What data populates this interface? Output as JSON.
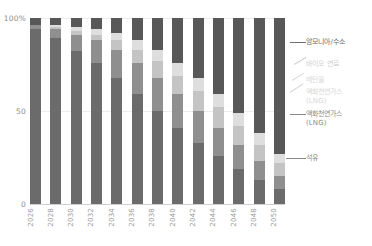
{
  "chart_data": {
    "type": "bar",
    "stacked": true,
    "normalized": true,
    "title": "",
    "subtitle": "",
    "xlabel": "",
    "ylabel": "",
    "ylim": [
      0,
      100
    ],
    "yticks": [
      "0",
      "50",
      "100%"
    ],
    "ytick_values": [
      0,
      50,
      100
    ],
    "grid": true,
    "legend_position": "right",
    "categories": [
      "2026",
      "2028",
      "2030",
      "2032",
      "2034",
      "2036",
      "2038",
      "2040",
      "2042",
      "2044",
      "2046",
      "2048",
      "2050"
    ],
    "series": [
      {
        "name": "석유",
        "color": "#6b6b6b",
        "values": [
          94,
          89,
          82,
          76,
          68,
          59,
          50,
          41,
          33,
          26,
          19,
          13,
          8
        ]
      },
      {
        "name": "액화천연가스 (LNG)",
        "color": "#8f8f8f",
        "values": [
          2,
          5,
          9,
          12,
          15,
          17,
          18,
          18,
          17,
          15,
          13,
          10,
          7
        ]
      },
      {
        "name": "메탄올",
        "color": "#c4c4c4",
        "values": [
          0,
          1,
          2,
          3,
          5,
          7,
          9,
          10,
          11,
          11,
          10,
          9,
          7
        ]
      },
      {
        "name": "바이오 연료",
        "color": "#dedede",
        "values": [
          0,
          1,
          2,
          3,
          4,
          5,
          6,
          7,
          7,
          7,
          7,
          6,
          5
        ]
      },
      {
        "name": "암모니아/수소",
        "color": "#585858",
        "values": [
          4,
          4,
          5,
          6,
          8,
          12,
          17,
          24,
          32,
          41,
          51,
          62,
          73
        ]
      }
    ]
  },
  "axis": {
    "y_ticks": [
      {
        "label": "100%",
        "value": 100
      },
      {
        "label": "50",
        "value": 50
      },
      {
        "label": "0",
        "value": 0
      }
    ]
  },
  "legend": {
    "items": [
      {
        "label": "암모니아/수소",
        "color": "#585858",
        "text_color": "#6d6d6d"
      },
      {
        "label": "바이오 연료",
        "color": "#dedede",
        "text_color": "#cfcfcf"
      },
      {
        "label": "메탄올",
        "color": "#c4c4c4",
        "text_color": "#dadada"
      },
      {
        "label": "액화천연가스\n(LNG)",
        "color": "#8f8f8f",
        "text_color": "#d6d6d6"
      },
      {
        "label": "액화천연가스\n(LNG)",
        "color": "#8f8f8f",
        "text_color": "#8a8a8a"
      },
      {
        "label": "석유",
        "color": "#6b6b6b",
        "text_color": "#8a8a8a"
      }
    ]
  }
}
